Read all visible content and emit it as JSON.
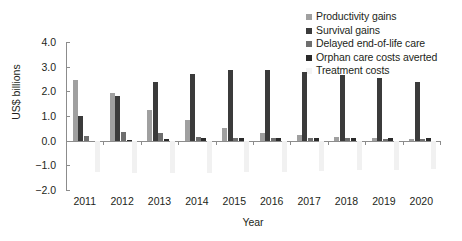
{
  "chart_data": {
    "type": "bar",
    "title": "",
    "subtitle": "",
    "xlabel": "Year",
    "ylabel": "US$ billions",
    "categories": [
      "2011",
      "2012",
      "2013",
      "2014",
      "2015",
      "2016",
      "2017",
      "2018",
      "2019",
      "2020"
    ],
    "ylim": [
      -2.0,
      4.0
    ],
    "yticks": [
      "4.0",
      "3.0",
      "2.0",
      "1.0",
      "0.0",
      "−1.0",
      "−2.0"
    ],
    "ytick_values": [
      4.0,
      3.0,
      2.0,
      1.0,
      0.0,
      -1.0,
      -2.0
    ],
    "grid": false,
    "legend_position": "top-right",
    "series": [
      {
        "name": "Productivity gains",
        "color": "#a0a0a0",
        "values": [
          2.45,
          1.93,
          1.25,
          0.83,
          0.5,
          0.33,
          0.22,
          0.16,
          0.12,
          0.08
        ]
      },
      {
        "name": "Survival gains",
        "color": "#3b3b3b",
        "values": [
          1.02,
          1.82,
          2.38,
          2.72,
          2.88,
          2.85,
          2.78,
          2.66,
          2.53,
          2.36
        ]
      },
      {
        "name": "Delayed end-of-life care",
        "color": "#6e6e6e",
        "values": [
          0.19,
          0.35,
          0.3,
          0.15,
          0.11,
          0.1,
          0.1,
          0.09,
          0.08,
          0.07
        ]
      },
      {
        "name": "Orphan care costs averted",
        "color": "#2a2a2a",
        "values": [
          0.0,
          0.03,
          0.08,
          0.09,
          0.11,
          0.11,
          0.11,
          0.11,
          0.11,
          0.11
        ]
      },
      {
        "name": "Treatment costs",
        "color": "#f1f1f1",
        "values": [
          -1.28,
          -1.3,
          -1.31,
          -1.3,
          -1.28,
          -1.26,
          -1.23,
          -1.2,
          -1.17,
          -1.14
        ]
      }
    ]
  },
  "legend": {
    "items": [
      {
        "label": "Productivity gains",
        "color": "#a0a0a0"
      },
      {
        "label": "Survival gains",
        "color": "#3b3b3b"
      },
      {
        "label": "Delayed end-of-life care",
        "color": "#6e6e6e"
      },
      {
        "label": "Orphan care costs averted",
        "color": "#2a2a2a"
      },
      {
        "label": "Treatment costs",
        "color": "#f4f4f4"
      }
    ]
  },
  "axes": {
    "x_title": "Year",
    "y_title": "US$ billions"
  },
  "colors": {
    "axis": "#8c8c8c",
    "text": "#231f20",
    "background": "#ffffff"
  }
}
